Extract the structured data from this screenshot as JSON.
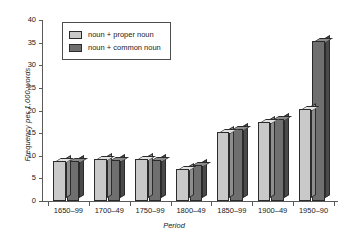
{
  "chart_data": {
    "type": "bar",
    "title": "",
    "subtitle": "",
    "xlabel": "Period",
    "ylabel": "Frequency per 1,000 words",
    "categories": [
      "1650–99",
      "1700–49",
      "1750–99",
      "1800–49",
      "1850–99",
      "1900–49",
      "1950–90"
    ],
    "series": [
      {
        "name": "noun + proper noun",
        "color": "#c9c9c9",
        "values": [
          8.8,
          9.2,
          9.2,
          7.0,
          15.3,
          17.4,
          20.4
        ]
      },
      {
        "name": "noun + common noun",
        "color": "#6f6f6f",
        "values": [
          8.8,
          9.0,
          9.0,
          8.0,
          15.9,
          18.1,
          35.3
        ]
      }
    ],
    "ylim": [
      0,
      40
    ],
    "yticks": [
      0,
      5,
      10,
      15,
      20,
      25,
      30,
      35,
      40
    ],
    "ytick_labels": [
      "0",
      "5",
      "10",
      "15",
      "20",
      "25",
      "30",
      "35",
      "40"
    ],
    "grid": false,
    "legend_position": "upper left",
    "style": "3d-bars"
  },
  "legend": {
    "entries": [
      {
        "label": "noun + proper noun",
        "swatch": "light-gray"
      },
      {
        "label": "noun + common noun",
        "swatch": "dark-gray"
      }
    ]
  }
}
